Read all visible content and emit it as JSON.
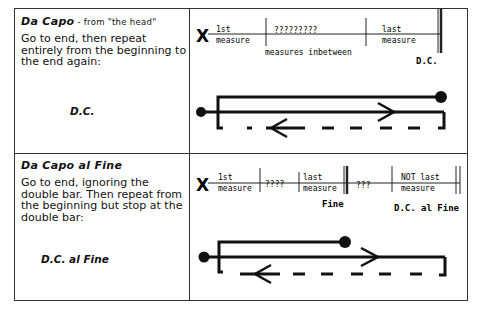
{
  "rows": [
    {
      "title": "Da Capo",
      "subtitle": " - from \"the head\"",
      "description": "Go to end, then repeat entirely from the beginning to the end again:",
      "sign": "D.C.",
      "staff": {
        "start_marker": "X",
        "measure1_top": "1st",
        "measure1_bottom": "measure",
        "middle_top": "?????????",
        "middle_bottom": "measures inbetween",
        "last_top": "last",
        "last_bottom": "measure",
        "end_label": "D.C."
      }
    },
    {
      "title": "Da Capo al Fine",
      "subtitle": "",
      "description": "Go to end, ignoring the double bar. Then repeat from the beginning but stop at the double bar:",
      "sign": "D.C. al Fine",
      "staff": {
        "start_marker": "X",
        "measure1_top": "1st",
        "measure1_bottom": "measure",
        "middle_top": "????",
        "last_top": "last",
        "last_bottom": "measure",
        "fine_label": "Fine",
        "after_fine": "???",
        "notlast_top": "NOT last",
        "notlast_bottom": "measure",
        "end_label": "D.C. al Fine"
      }
    }
  ]
}
